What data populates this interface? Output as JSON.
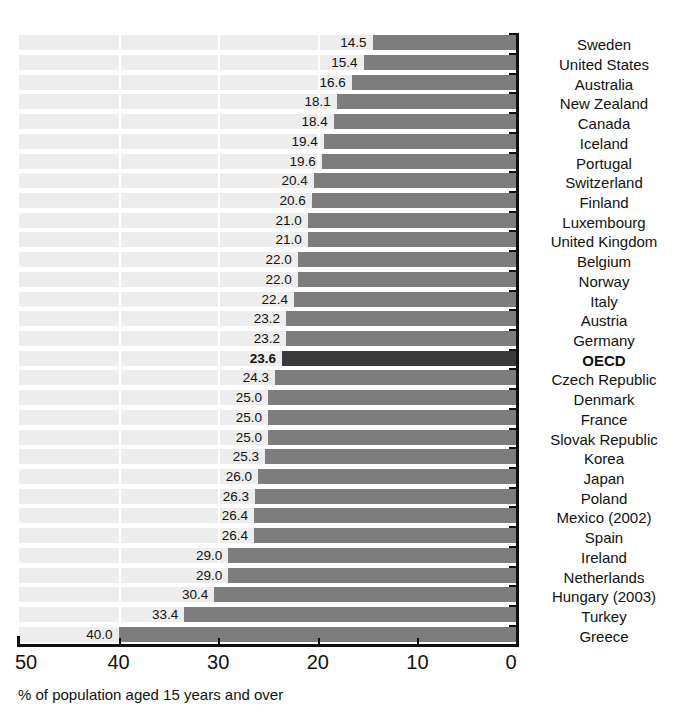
{
  "chart_data": {
    "type": "bar",
    "orientation": "horizontal",
    "title": "",
    "subtitle": "",
    "xlabel": "% of population aged 15 years and over",
    "ylabel": "",
    "xlim": [
      50,
      0
    ],
    "x_axis_reversed": true,
    "xticks": [
      50,
      40,
      30,
      20,
      10,
      0
    ],
    "xtick_labels": [
      "50",
      "40",
      "30",
      "20",
      "10",
      "0"
    ],
    "grid": "vertical-white-on-banded-rows",
    "legend": null,
    "legend_position": null,
    "highlight_category": "OECD",
    "colors": {
      "bar": "#7d7d7d",
      "bar_highlight": "#3a3a3a",
      "row_band": "#ededed",
      "axis": "#111111",
      "text": "#111111",
      "background": "#ffffff"
    },
    "categories": [
      "Sweden",
      "United States",
      "Australia",
      "New Zealand",
      "Canada",
      "Iceland",
      "Portugal",
      "Switzerland",
      "Finland",
      "Luxembourg",
      "United Kingdom",
      "Belgium",
      "Norway",
      "Italy",
      "Austria",
      "Germany",
      "OECD",
      "Czech Republic",
      "Denmark",
      "France",
      "Slovak Republic",
      "Korea",
      "Japan",
      "Poland",
      "Mexico (2002)",
      "Spain",
      "Ireland",
      "Netherlands",
      "Hungary (2003)",
      "Turkey",
      "Greece"
    ],
    "values": [
      14.5,
      15.4,
      16.6,
      18.1,
      18.4,
      19.4,
      19.6,
      20.4,
      20.6,
      21.0,
      21.0,
      22.0,
      22.0,
      22.4,
      23.2,
      23.2,
      23.6,
      24.3,
      25.0,
      25.0,
      25.0,
      25.3,
      26.0,
      26.3,
      26.4,
      26.4,
      29.0,
      29.0,
      30.4,
      33.4,
      40.0
    ],
    "data_labels": [
      "14.5",
      "15.4",
      "16.6",
      "18.1",
      "18.4",
      "19.4",
      "19.6",
      "20.4",
      "20.6",
      "21.0",
      "21.0",
      "22.0",
      "22.0",
      "22.4",
      "23.2",
      "23.2",
      "23.6",
      "24.3",
      "25.0",
      "25.0",
      "25.0",
      "25.3",
      "26.0",
      "26.3",
      "26.4",
      "26.4",
      "29.0",
      "29.0",
      "30.4",
      "33.4",
      "40.0"
    ]
  }
}
